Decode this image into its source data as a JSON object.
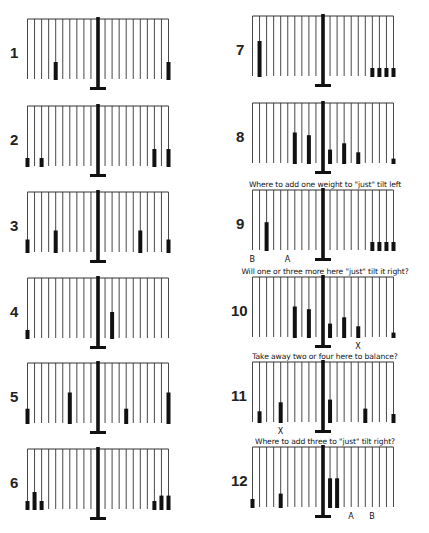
{
  "diagram": {
    "strings_per_side": 10,
    "panels": [
      {
        "id": 1,
        "number": "1",
        "column": 0,
        "row": 0,
        "caption": "",
        "left": [
          {
            "pos": 6,
            "count": 2
          }
        ],
        "right": [
          {
            "pos": 10,
            "count": 2
          }
        ],
        "labels": []
      },
      {
        "id": 2,
        "number": "2",
        "column": 0,
        "row": 1,
        "caption": "",
        "left": [
          {
            "pos": 10,
            "count": 1
          },
          {
            "pos": 8,
            "count": 1
          }
        ],
        "right": [
          {
            "pos": 8,
            "count": 2
          },
          {
            "pos": 10,
            "count": 2
          }
        ],
        "labels": []
      },
      {
        "id": 3,
        "number": "3",
        "column": 0,
        "row": 2,
        "caption": "",
        "left": [
          {
            "pos": 10,
            "count": 1.5
          },
          {
            "pos": 6,
            "count": 2.5
          }
        ],
        "right": [
          {
            "pos": 6,
            "count": 2.5
          },
          {
            "pos": 10,
            "count": 1.5
          }
        ],
        "labels": []
      },
      {
        "id": 4,
        "number": "4",
        "column": 0,
        "row": 3,
        "caption": "",
        "left": [
          {
            "pos": 10,
            "count": 1
          }
        ],
        "right": [
          {
            "pos": 2,
            "count": 3
          }
        ],
        "labels": []
      },
      {
        "id": 5,
        "number": "5",
        "column": 0,
        "row": 4,
        "caption": "",
        "left": [
          {
            "pos": 10,
            "count": 1.7
          },
          {
            "pos": 4,
            "count": 3.5
          }
        ],
        "right": [
          {
            "pos": 4,
            "count": 1.7
          },
          {
            "pos": 10,
            "count": 3.5
          }
        ],
        "labels": []
      },
      {
        "id": 6,
        "number": "6",
        "column": 0,
        "row": 5,
        "caption": "",
        "left": [
          {
            "pos": 10,
            "count": 1
          },
          {
            "pos": 9,
            "count": 2
          },
          {
            "pos": 8,
            "count": 1
          }
        ],
        "right": [
          {
            "pos": 8,
            "count": 1
          },
          {
            "pos": 9,
            "count": 1.6
          },
          {
            "pos": 10,
            "count": 1.6
          }
        ],
        "labels": []
      },
      {
        "id": 7,
        "number": "7",
        "column": 1,
        "row": 0,
        "caption": "",
        "left": [
          {
            "pos": 9,
            "count": 4
          }
        ],
        "right": [
          {
            "pos": 7,
            "count": 1
          },
          {
            "pos": 8,
            "count": 1
          },
          {
            "pos": 9,
            "count": 1
          },
          {
            "pos": 10,
            "count": 1
          }
        ],
        "labels": []
      },
      {
        "id": 8,
        "number": "8",
        "column": 1,
        "row": 1,
        "caption": "",
        "left": [
          {
            "pos": 4,
            "count": 3.5
          },
          {
            "pos": 2,
            "count": 3.2
          }
        ],
        "right": [
          {
            "pos": 1,
            "count": 1.6
          },
          {
            "pos": 3,
            "count": 2.3
          },
          {
            "pos": 5,
            "count": 1.3
          },
          {
            "pos": 10,
            "count": 0.6
          }
        ],
        "labels": []
      },
      {
        "id": 9,
        "number": "9",
        "column": 1,
        "row": 2,
        "caption": "Where to add one weight to \"just\" tilt left",
        "left": [
          {
            "pos": 8,
            "count": 3.2
          }
        ],
        "right": [
          {
            "pos": 7,
            "count": 1
          },
          {
            "pos": 8,
            "count": 1
          },
          {
            "pos": 9,
            "count": 1
          },
          {
            "pos": 10,
            "count": 1
          }
        ],
        "labels": [
          {
            "text": "B",
            "side": "left",
            "pos": 10
          },
          {
            "text": "A",
            "side": "left",
            "pos": 5
          }
        ]
      },
      {
        "id": 10,
        "number": "10",
        "column": 1,
        "row": 3,
        "caption": "Will one or three more here \"just\" tilt it right?",
        "left": [
          {
            "pos": 4,
            "count": 3.5
          },
          {
            "pos": 2,
            "count": 3.2
          }
        ],
        "right": [
          {
            "pos": 1,
            "count": 1.6
          },
          {
            "pos": 3,
            "count": 2.3
          },
          {
            "pos": 5,
            "count": 1.3
          },
          {
            "pos": 10,
            "count": 0.6
          }
        ],
        "labels": [
          {
            "text": "X",
            "side": "right",
            "pos": 5
          }
        ]
      },
      {
        "id": 11,
        "number": "11",
        "column": 1,
        "row": 4,
        "caption": "Take away two or four here to balance?",
        "left": [
          {
            "pos": 9,
            "count": 1.3
          },
          {
            "pos": 6,
            "count": 2.3
          }
        ],
        "right": [
          {
            "pos": 1,
            "count": 2.6
          },
          {
            "pos": 6,
            "count": 1.6
          },
          {
            "pos": 10,
            "count": 1
          }
        ],
        "labels": [
          {
            "text": "X",
            "side": "left",
            "pos": 6
          }
        ]
      },
      {
        "id": 12,
        "number": "12",
        "column": 1,
        "row": 5,
        "caption": "Where to add three to \"just\" tilt right?",
        "left": [
          {
            "pos": 10,
            "count": 1
          },
          {
            "pos": 6,
            "count": 1.6
          }
        ],
        "right": [
          {
            "pos": 1,
            "count": 3.3
          },
          {
            "pos": 2,
            "count": 3.3
          }
        ],
        "labels": [
          {
            "text": "A",
            "side": "right",
            "pos": 4
          },
          {
            "text": "B",
            "side": "right",
            "pos": 7
          }
        ]
      }
    ]
  },
  "colors": {
    "ink": "#111111",
    "string": "#333333",
    "background": "#ffffff"
  }
}
